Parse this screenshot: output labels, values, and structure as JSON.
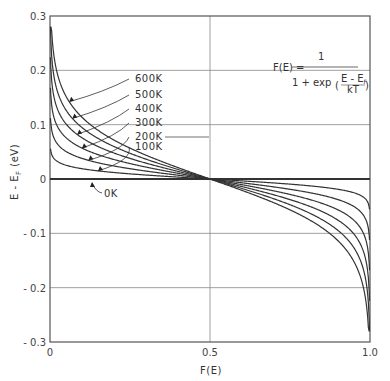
{
  "chart_data": {
    "type": "line",
    "title": "",
    "xlabel": "F(E)",
    "ylabel": "E - E_F (eV)",
    "xlim": [
      0,
      1.0
    ],
    "ylim": [
      -0.3,
      0.3
    ],
    "x_ticks": [
      "0",
      "0.5",
      "1.0"
    ],
    "y_ticks": [
      "0.3",
      "0.2",
      "0.1",
      "0",
      "-0.1",
      "-0.2",
      "-0.3"
    ],
    "grid": true,
    "formula": {
      "lhs": "F(E) =",
      "numerator": "1",
      "denominator_prefix": "1 + exp",
      "inner_numerator": "E - E",
      "inner_numerator_sub": "F",
      "inner_denominator": "kT"
    },
    "boltzmann_eV_per_K": 8.617e-05,
    "series": [
      {
        "name": "0K",
        "temperature": 0,
        "label": "0K"
      },
      {
        "name": "100K",
        "temperature": 100,
        "label": "100K"
      },
      {
        "name": "200K",
        "temperature": 200,
        "label": "200K"
      },
      {
        "name": "300K",
        "temperature": 300,
        "label": "300K"
      },
      {
        "name": "400K",
        "temperature": 400,
        "label": "400K"
      },
      {
        "name": "500K",
        "temperature": 500,
        "label": "500K"
      },
      {
        "name": "600K",
        "temperature": 600,
        "label": "600K"
      }
    ],
    "sample_points": {
      "F": [
        0.01,
        0.1,
        0.5,
        0.9,
        0.99
      ],
      "600K": [
        0.238,
        0.114,
        0.0,
        -0.114,
        -0.238
      ],
      "300K": [
        0.119,
        0.057,
        0.0,
        -0.057,
        -0.119
      ],
      "100K": [
        0.04,
        0.019,
        0.0,
        -0.019,
        -0.04
      ]
    }
  },
  "labels": {
    "600K": "600K",
    "500K": "500K",
    "400K": "400K",
    "300K": "300K",
    "200K": "200K",
    "100K": "100K",
    "0K": "0K"
  }
}
